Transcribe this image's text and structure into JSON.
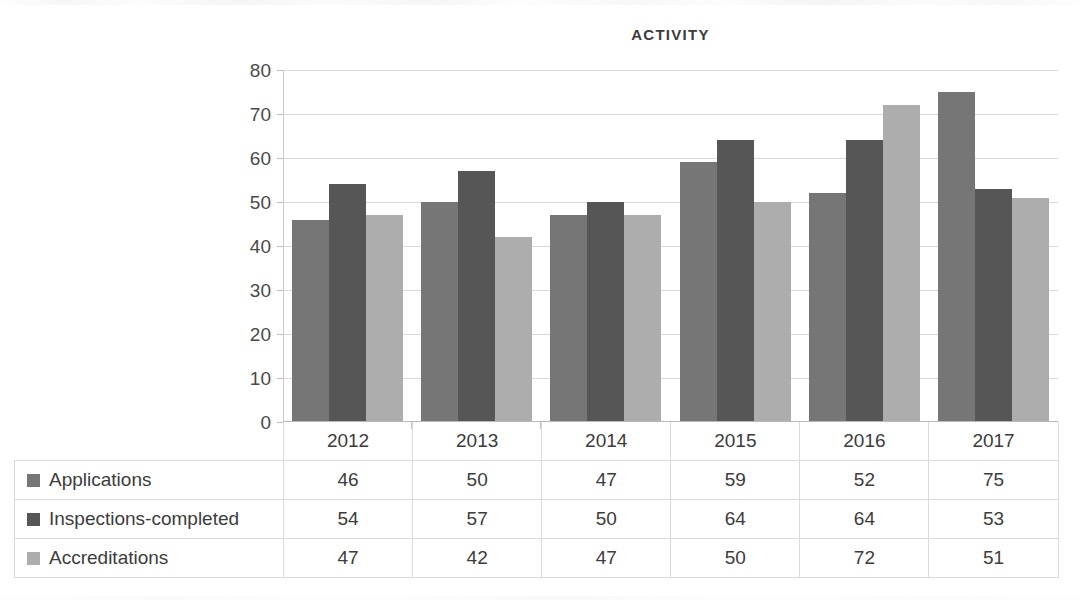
{
  "chart_data": {
    "type": "bar",
    "title": "ACTIVITY",
    "xlabel": "",
    "ylabel": "",
    "ylim": [
      0,
      80
    ],
    "ytick_step": 10,
    "yticks": [
      80,
      70,
      60,
      50,
      40,
      30,
      20,
      10,
      0
    ],
    "grid": true,
    "legend_position": "table-row-labels",
    "categories": [
      "2012",
      "2013",
      "2014",
      "2015",
      "2016",
      "2017"
    ],
    "series": [
      {
        "name": "Applications",
        "values": [
          46,
          50,
          47,
          59,
          52,
          75
        ],
        "color": "#767676"
      },
      {
        "name": "Inspections-completed",
        "values": [
          54,
          57,
          50,
          64,
          64,
          53
        ],
        "color": "#565656"
      },
      {
        "name": "Accreditations",
        "values": [
          47,
          42,
          47,
          50,
          72,
          51
        ],
        "color": "#adadad"
      }
    ]
  },
  "table": {
    "corner_label": "",
    "column_headers": [
      "2012",
      "2013",
      "2014",
      "2015",
      "2016",
      "2017"
    ],
    "rows": [
      {
        "label": "Applications",
        "swatch_color": "#767676",
        "values": [
          "46",
          "50",
          "47",
          "59",
          "52",
          "75"
        ]
      },
      {
        "label": "Inspections-completed",
        "swatch_color": "#565656",
        "values": [
          "54",
          "57",
          "50",
          "64",
          "64",
          "53"
        ]
      },
      {
        "label": "Accreditations",
        "swatch_color": "#adadad",
        "values": [
          "47",
          "42",
          "47",
          "50",
          "72",
          "51"
        ]
      }
    ]
  },
  "colors": {
    "series_1": "#767676",
    "series_2": "#565656",
    "series_3": "#adadad",
    "gridline": "#d9d9d9",
    "table_border": "#dadada",
    "text": "#3c3c3c"
  }
}
